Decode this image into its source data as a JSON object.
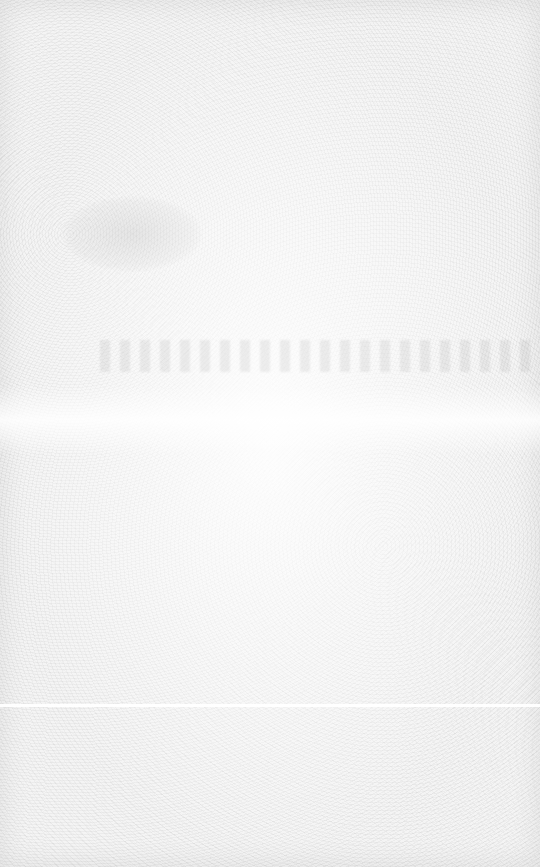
{
  "page": {
    "background_color": "#f4f4f4"
  }
}
